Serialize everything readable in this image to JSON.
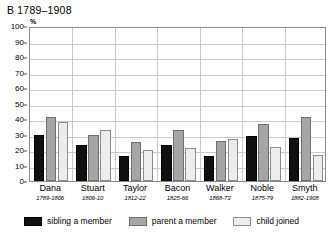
{
  "chart_data": {
    "type": "bar",
    "title": "B 1789–1908",
    "xlabel": "",
    "ylabel": "%",
    "ylim": [
      0,
      100
    ],
    "yticks": [
      0,
      10,
      20,
      30,
      40,
      50,
      60,
      70,
      80,
      90,
      100
    ],
    "grid": true,
    "legend_position": "bottom",
    "categories": [
      "Dana",
      "Stuart",
      "Taylor",
      "Bacon",
      "Walker",
      "Noble",
      "Smyth"
    ],
    "category_subtitles": [
      "1789-1806",
      "1806-10",
      "1812-22",
      "1825-66",
      "1868-73",
      "1875-79",
      "1882-1908"
    ],
    "series": [
      {
        "name": "sibling a member",
        "color": "#101010",
        "values": [
          30,
          23,
          16,
          23,
          16,
          29,
          28
        ]
      },
      {
        "name": "parent a member",
        "color": "#a5a5a5",
        "values": [
          41,
          30,
          25,
          33,
          26,
          37,
          41
        ]
      },
      {
        "name": "child joined",
        "color": "#ececec",
        "values": [
          38,
          33,
          20,
          21,
          27,
          22,
          17
        ]
      }
    ]
  }
}
